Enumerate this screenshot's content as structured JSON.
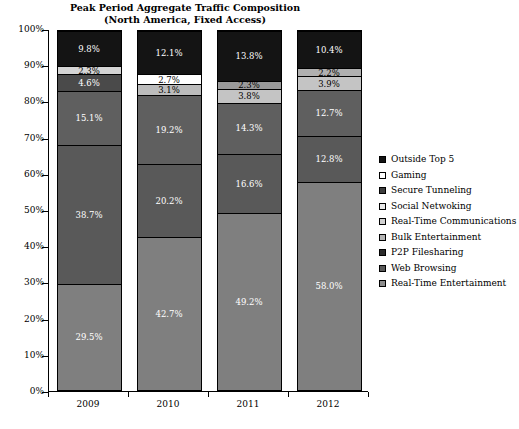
{
  "chart_data": {
    "type": "bar",
    "subtype": "stacked-percentage-column",
    "title": "Peak Period Aggregate Traffic Composition",
    "subtitle": "(North America, Fixed Access)",
    "xlabel": "",
    "ylabel": "",
    "categories": [
      "2009",
      "2010",
      "2011",
      "2012"
    ],
    "ylim": [
      0,
      100
    ],
    "ytick_labels": [
      "0%",
      "10%",
      "20%",
      "30%",
      "40%",
      "50%",
      "60%",
      "70%",
      "80%",
      "90%",
      "100%"
    ],
    "ytick_values": [
      0,
      10,
      20,
      30,
      40,
      50,
      60,
      70,
      80,
      90,
      100
    ],
    "grid": false,
    "legend_position": "right",
    "stack_order_bottom_to_top": [
      "Real-Time Entertainment",
      "Web Browsing",
      "P2P Filesharing",
      "Bulk Entertainment",
      "Real-Time Communications",
      "Social Netwoking",
      "Secure Tunneling",
      "Gaming",
      "Outside Top 5"
    ],
    "series": [
      {
        "name": "Real-Time Entertainment",
        "color": "#7f7f7f",
        "text_color": "#ffffff",
        "values": [
          29.5,
          42.7,
          49.2,
          58.0
        ],
        "labels": [
          "29.5%",
          "42.7%",
          "49.2%",
          "58.0%"
        ]
      },
      {
        "name": "Web Browsing",
        "color": "#595959",
        "text_color": "#ffffff",
        "values": [
          38.7,
          20.2,
          16.6,
          12.8
        ],
        "labels": [
          "38.7%",
          "20.2%",
          "16.6%",
          "12.8%"
        ]
      },
      {
        "name": "P2P Filesharing",
        "color": "#4d4d4d",
        "text_color": "#ffffff",
        "values": [
          0.0,
          0.0,
          0.0,
          0.0
        ],
        "labels": [
          "",
          "",
          "",
          ""
        ]
      },
      {
        "name": "Bulk Entertainment",
        "color": "#5f5f5f",
        "text_color": "#ffffff",
        "values": [
          15.1,
          19.2,
          14.3,
          12.7
        ],
        "labels": [
          "15.1%",
          "19.2%",
          "14.3%",
          "12.7%"
        ]
      },
      {
        "name": "Real-Time Communications",
        "color": "#4a4a4a",
        "text_color": "#ffffff",
        "values": [
          4.6,
          3.1,
          3.8,
          3.9
        ],
        "labels": [
          "4.6%",
          "3.1%",
          "3.8%",
          "3.9%"
        ]
      },
      {
        "name": "Social Netwoking",
        "color": "#bfbfbf",
        "text_color": "#000000",
        "values": [
          2.3,
          2.7,
          2.3,
          2.2
        ],
        "labels": [
          "2.3%",
          "2.7%",
          "2.3%",
          "2.2%"
        ]
      },
      {
        "name": "Secure Tunneling",
        "color": "#ffffff",
        "text_color": "#000000",
        "values": [
          0.0,
          0.0,
          0.0,
          0.0
        ],
        "labels": [
          "",
          "",
          "",
          ""
        ]
      },
      {
        "name": "Gaming",
        "color": "#ffffff",
        "text_color": "#000000",
        "values": [
          0.0,
          0.0,
          0.0,
          0.0
        ],
        "labels": [
          "",
          "",
          "",
          ""
        ]
      },
      {
        "name": "Outside Top 5",
        "color": "#141414",
        "text_color": "#ffffff",
        "values": [
          9.8,
          12.1,
          13.8,
          10.4
        ],
        "labels": [
          "9.8%",
          "12.1%",
          "13.8%",
          "10.4%"
        ]
      }
    ],
    "bars": [
      {
        "category": "2009",
        "segments_bottom_to_top": [
          {
            "name": "Real-Time Entertainment",
            "value": 29.5,
            "label": "29.5%",
            "color": "#7f7f7f",
            "text": "light"
          },
          {
            "name": "Web Browsing",
            "value": 38.7,
            "label": "38.7%",
            "color": "#595959",
            "text": "light"
          },
          {
            "name": "Bulk Entertainment",
            "value": 15.1,
            "label": "15.1%",
            "color": "#5f5f5f",
            "text": "light"
          },
          {
            "name": "Real-Time Communications",
            "value": 4.6,
            "label": "4.6%",
            "color": "#4a4a4a",
            "text": "light"
          },
          {
            "name": "Social Netwoking",
            "value": 2.3,
            "label": "2.3%",
            "color": "#d4d4d4",
            "text": "dark"
          },
          {
            "name": "Outside Top 5",
            "value": 9.8,
            "label": "9.8%",
            "color": "#141414",
            "text": "light"
          }
        ]
      },
      {
        "category": "2010",
        "segments_bottom_to_top": [
          {
            "name": "Real-Time Entertainment",
            "value": 42.7,
            "label": "42.7%",
            "color": "#7f7f7f",
            "text": "light"
          },
          {
            "name": "Web Browsing",
            "value": 20.2,
            "label": "20.2%",
            "color": "#595959",
            "text": "light"
          },
          {
            "name": "Bulk Entertainment",
            "value": 19.2,
            "label": "19.2%",
            "color": "#5f5f5f",
            "text": "light"
          },
          {
            "name": "Real-Time Communications",
            "value": 3.1,
            "label": "3.1%",
            "color": "#bcbcbc",
            "text": "dark"
          },
          {
            "name": "Social Netwoking",
            "value": 2.7,
            "label": "2.7%",
            "color": "#ffffff",
            "text": "dark"
          },
          {
            "name": "Outside Top 5",
            "value": 12.1,
            "label": "12.1%",
            "color": "#141414",
            "text": "light"
          }
        ]
      },
      {
        "category": "2011",
        "segments_bottom_to_top": [
          {
            "name": "Real-Time Entertainment",
            "value": 49.2,
            "label": "49.2%",
            "color": "#7f7f7f",
            "text": "light"
          },
          {
            "name": "Web Browsing",
            "value": 16.6,
            "label": "16.6%",
            "color": "#595959",
            "text": "light"
          },
          {
            "name": "Bulk Entertainment",
            "value": 14.3,
            "label": "14.3%",
            "color": "#5f5f5f",
            "text": "light"
          },
          {
            "name": "Real-Time Communications",
            "value": 3.8,
            "label": "3.8%",
            "color": "#c4c4c4",
            "text": "dark"
          },
          {
            "name": "Social Netwoking",
            "value": 2.3,
            "label": "2.3%",
            "color": "#9a9a9a",
            "text": "dark"
          },
          {
            "name": "Outside Top 5",
            "value": 13.8,
            "label": "13.8%",
            "color": "#141414",
            "text": "light"
          }
        ]
      },
      {
        "category": "2012",
        "segments_bottom_to_top": [
          {
            "name": "Real-Time Entertainment",
            "value": 58.0,
            "label": "58.0%",
            "color": "#7f7f7f",
            "text": "light"
          },
          {
            "name": "Web Browsing",
            "value": 12.8,
            "label": "12.8%",
            "color": "#595959",
            "text": "light"
          },
          {
            "name": "Bulk Entertainment",
            "value": 12.7,
            "label": "12.7%",
            "color": "#5f5f5f",
            "text": "light"
          },
          {
            "name": "Real-Time Communications",
            "value": 3.9,
            "label": "3.9%",
            "color": "#c4c4c4",
            "text": "dark"
          },
          {
            "name": "Social Netwoking",
            "value": 2.2,
            "label": "2.2%",
            "color": "#b0b0b0",
            "text": "dark"
          },
          {
            "name": "Outside Top 5",
            "value": 10.4,
            "label": "10.4%",
            "color": "#141414",
            "text": "light"
          }
        ]
      }
    ],
    "legend": [
      {
        "label": "Outside Top 5",
        "color": "#141414"
      },
      {
        "label": "Gaming",
        "color": "#ffffff"
      },
      {
        "label": "Secure Tunneling",
        "color": "#3d3d3d"
      },
      {
        "label": "Social Netwoking",
        "color": "#e8e8e8"
      },
      {
        "label": "Real-Time Communications",
        "color": "#d0d0d0"
      },
      {
        "label": "Bulk Entertainment",
        "color": "#b4b4b4"
      },
      {
        "label": "P2P Filesharing",
        "color": "#2b2b2b"
      },
      {
        "label": "Web Browsing",
        "color": "#595959"
      },
      {
        "label": "Real-Time Entertainment",
        "color": "#8c8c8c"
      }
    ]
  }
}
